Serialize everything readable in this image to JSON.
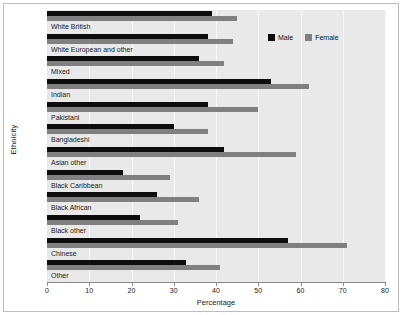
{
  "chart_data": {
    "type": "bar",
    "orientation": "horizontal",
    "title": "",
    "xlabel": "Percentage",
    "ylabel": "Ethnicity",
    "xlim": [
      0,
      80
    ],
    "xticks": [
      0,
      10,
      20,
      30,
      40,
      50,
      60,
      70,
      80
    ],
    "grid": true,
    "legend_position": "top-right",
    "categories": [
      "White British",
      "White European and other",
      "Mixed",
      "Indian",
      "Pakistani",
      "Bangladeshi",
      "Asian other",
      "Black Caribbean",
      "Black African",
      "Black other",
      "Chinese",
      "Other"
    ],
    "series": [
      {
        "name": "Male",
        "color": "#0d0d0d",
        "values": [
          39,
          38,
          36,
          53,
          38,
          30,
          42,
          18,
          26,
          22,
          57,
          33
        ]
      },
      {
        "name": "Female",
        "color": "#808080",
        "values": [
          45,
          44,
          42,
          62,
          50,
          38,
          59,
          29,
          36,
          31,
          71,
          41
        ]
      }
    ]
  }
}
